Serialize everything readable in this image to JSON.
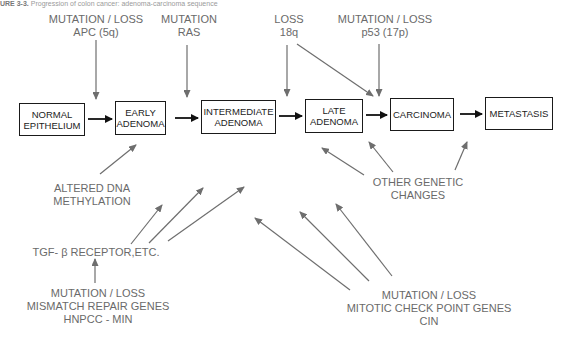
{
  "caption": {
    "prefix": "URE 3-3.",
    "text": "Progression of colon cancer: adenoma-carcinoma sequence"
  },
  "stages": [
    {
      "id": "normal",
      "lines": [
        "NORMAL",
        "EPITHELIUM"
      ]
    },
    {
      "id": "early",
      "lines": [
        "EARLY",
        "ADENOMA"
      ]
    },
    {
      "id": "intermediate",
      "lines": [
        "INTERMEDIATE",
        "ADENOMA"
      ]
    },
    {
      "id": "late",
      "lines": [
        "LATE",
        "ADENOMA"
      ]
    },
    {
      "id": "carcinoma",
      "lines": [
        "CARCINOMA"
      ]
    },
    {
      "id": "metastasis",
      "lines": [
        "METASTASIS"
      ]
    }
  ],
  "top_labels": {
    "apc": {
      "lines": [
        "MUTATION / LOSS",
        "APC (5q)"
      ]
    },
    "ras": {
      "lines": [
        "MUTATION",
        "RAS"
      ]
    },
    "loss18q": {
      "lines": [
        "LOSS",
        "18q"
      ]
    },
    "p53": {
      "lines": [
        "MUTATION / LOSS",
        "p53 (17p)"
      ]
    }
  },
  "bottom_labels": {
    "methylation": {
      "lines": [
        "ALTERED DNA",
        "METHYLATION"
      ]
    },
    "other": {
      "lines": [
        "OTHER GENETIC",
        "CHANGES"
      ]
    },
    "tgf": {
      "lines": [
        "TGF- β RECEPTOR,ETC."
      ]
    },
    "mismatch": {
      "lines": [
        "MUTATION / LOSS",
        "MISMATCH REPAIR GENES",
        "HNPCC - MIN"
      ]
    },
    "mitotic": {
      "lines": [
        "MUTATION / LOSS",
        "MITOTIC CHECK POINT GENES",
        "CIN"
      ]
    }
  },
  "colors": {
    "box_border": "#1a1a1a",
    "main_arrow": "#111111",
    "influence_arrow": "#6e6e6e",
    "label_text": "#6a6a6a"
  }
}
